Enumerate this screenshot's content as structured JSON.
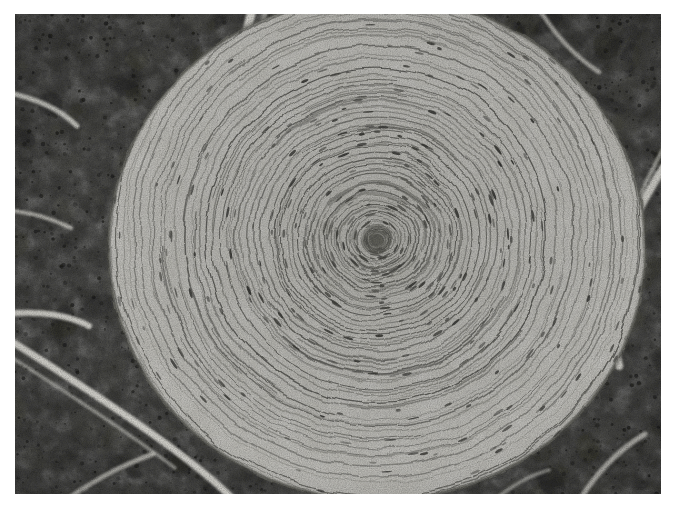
{
  "figure": {
    "kind": "light-microscopy-histology-photomicrograph",
    "stain": "haematoxylin and eosin (reproduced in greyscale)",
    "orientation": "landscape",
    "caption": "",
    "label": ""
  },
  "canvas": {
    "width": 677,
    "height": 514,
    "background": "#ffffff",
    "plate": {
      "x": 15,
      "y": 14,
      "width": 646,
      "height": 480
    }
  },
  "palette": {
    "page_white": "#ffffff",
    "plate_border": "#8f8f8b",
    "stroma_dark": "#3a3a37",
    "stroma_mid": "#55554f",
    "stroma_light": "#6f6f68",
    "septum_white": "#e8e7e0",
    "corpuscle_light": "#bdbcb6",
    "corpuscle_mid": "#a9a8a2",
    "lamella_line": "#4a4a46",
    "lamella_line_soft": "#6b6b65",
    "core_dark": "#5d5d58",
    "capsule_edge": "#7c7c75"
  },
  "chart_data": {
    "type": "heatmap",
    "xlabel": "",
    "ylabel": "",
    "regions": [
      {
        "name": "lamellated-corpuscle",
        "role": "primary-structure",
        "shape": "ellipse",
        "cx": 377,
        "cy": 248,
        "rx": 268,
        "ry": 252,
        "fill": "#bdbcb6"
      },
      {
        "name": "inner-core",
        "role": "inner-bulb",
        "shape": "ellipse",
        "cx": 377,
        "cy": 240,
        "rx": 16,
        "ry": 15,
        "fill": "#5d5d58"
      },
      {
        "name": "acinar-tissue-top-left",
        "role": "surrounding-exocrine-pancreas",
        "fill": "#3a3a37"
      },
      {
        "name": "acinar-tissue-top-right",
        "role": "surrounding-exocrine-pancreas",
        "fill": "#3a3a37"
      },
      {
        "name": "acinar-tissue-bottom-left",
        "role": "surrounding-exocrine-pancreas",
        "fill": "#3a3a37"
      },
      {
        "name": "acinar-tissue-bottom-right",
        "role": "surrounding-exocrine-pancreas",
        "fill": "#3a3a37"
      },
      {
        "name": "fibrous-septum-upper-left",
        "role": "connective-tissue-septum",
        "fill": "#e8e7e0"
      },
      {
        "name": "fibrous-septum-lower-left",
        "role": "connective-tissue-septum",
        "fill": "#e8e7e0"
      },
      {
        "name": "fibrous-septum-right",
        "role": "connective-tissue-septum",
        "fill": "#e8e7e0"
      }
    ],
    "lamellae": {
      "description": "concentric onion-skin lamellae of the corpuscle capsule",
      "count": 46,
      "centre": [
        377,
        240
      ],
      "innermost_radius": 9,
      "outermost_radius": 272,
      "spacing_inner_px": 3.5,
      "spacing_outer_px": 13
    },
    "grid": false,
    "legend": null,
    "annotations": []
  }
}
